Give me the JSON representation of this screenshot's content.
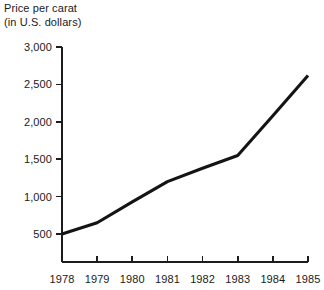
{
  "chart_data": {
    "type": "line",
    "title_line1": "Price per carat",
    "title_line2": "(in U.S. dollars)",
    "xlabel": "",
    "ylabel": "",
    "categories": [
      "1978",
      "1979",
      "1980",
      "1981",
      "1982",
      "1983",
      "1984",
      "1985"
    ],
    "x": [
      1978,
      1979,
      1980,
      1981,
      1982,
      1983,
      1984,
      1985
    ],
    "values": [
      500,
      650,
      930,
      1200,
      1380,
      1550,
      2080,
      2620
    ],
    "series": [
      {
        "name": "Price per carat",
        "values": [
          500,
          650,
          930,
          1200,
          1380,
          1550,
          2080,
          2620
        ]
      }
    ],
    "ylim": [
      0,
      3000
    ],
    "yticks": [
      500,
      1000,
      1500,
      2000,
      2500,
      3000
    ],
    "ytick_labels": [
      "500",
      "1,000",
      "1,500",
      "2,000",
      "2,500",
      "3,000"
    ],
    "xtick_labels": [
      "1978",
      "1979",
      "1980",
      "1981",
      "1982",
      "1983",
      "1984",
      "1985"
    ],
    "grid": false,
    "legend": false,
    "legend_position": "none",
    "line_color": "#141414"
  }
}
